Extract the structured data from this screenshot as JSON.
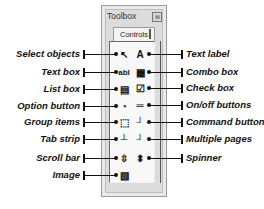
{
  "window": {
    "title": "Toolbox",
    "close_glyph": "⊠",
    "tab_label": "Controls"
  },
  "left_labels": [
    {
      "text": "Select objects",
      "y": 54,
      "icon": "↖",
      "icon_name": "select-objects-icon"
    },
    {
      "text": "Text box",
      "y": 72,
      "icon": "abl",
      "icon_name": "text-box-icon"
    },
    {
      "text": "List box",
      "y": 89,
      "icon": "▤",
      "icon_name": "list-box-icon"
    },
    {
      "text": "Option button",
      "y": 106,
      "icon": "◔",
      "icon_name": "option-button-icon"
    },
    {
      "text": "Group items",
      "y": 122,
      "icon": "⬚",
      "icon_name": "group-items-icon"
    },
    {
      "text": "Tab strip",
      "y": 139,
      "icon": "┴",
      "icon_name": "tab-strip-icon"
    },
    {
      "text": "Scroll bar",
      "y": 158,
      "icon": "⇳",
      "icon_name": "scroll-bar-icon"
    },
    {
      "text": "Image",
      "y": 175,
      "icon": "▧",
      "icon_name": "image-icon"
    }
  ],
  "right_labels": [
    {
      "text": "Text label",
      "y": 54,
      "icon": "A",
      "icon_name": "text-label-icon"
    },
    {
      "text": "Combo box",
      "y": 72,
      "icon": "▦",
      "icon_name": "combo-box-icon"
    },
    {
      "text": "Check box",
      "y": 88,
      "icon": "☑",
      "icon_name": "check-box-icon"
    },
    {
      "text": "On/off buttons",
      "y": 105,
      "icon": "═",
      "icon_name": "on-off-buttons-icon"
    },
    {
      "text": "Command button",
      "y": 122,
      "icon": "┘",
      "icon_name": "command-button-icon"
    },
    {
      "text": "Multiple pages",
      "y": 139,
      "icon": "┘",
      "icon_name": "multiple-pages-icon"
    },
    {
      "text": "Spinner",
      "y": 158,
      "icon": "⬍",
      "icon_name": "spinner-icon"
    }
  ]
}
